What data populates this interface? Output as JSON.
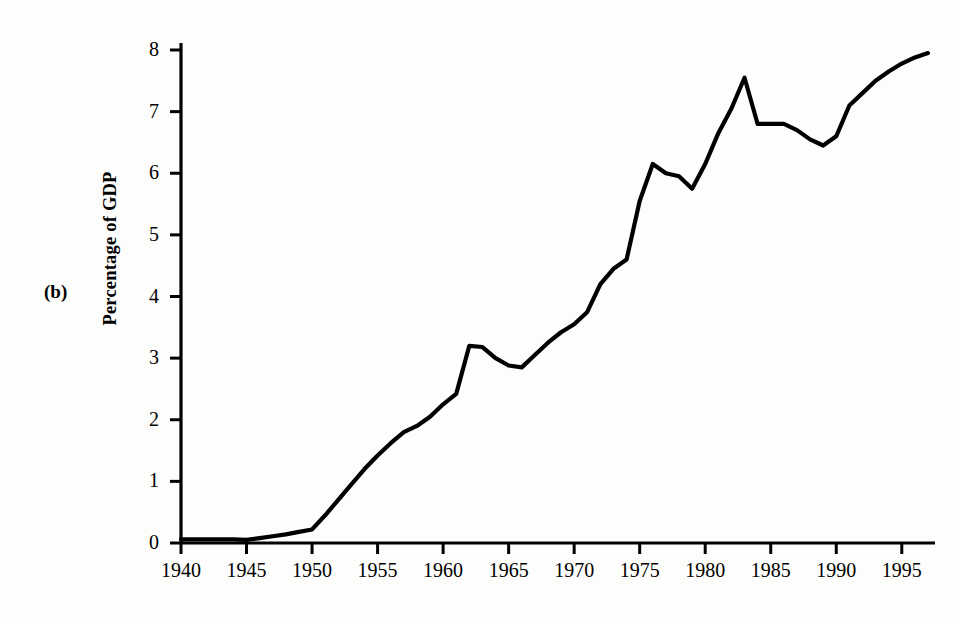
{
  "figure": {
    "panel_label": "(b)",
    "background_color": "#fdfdfb",
    "line_color": "#000000"
  },
  "chart_data": {
    "type": "line",
    "title": "",
    "subtitle": "",
    "xlabel": "",
    "ylabel": "Percentage of GDP",
    "xlim": [
      1940,
      1997
    ],
    "ylim": [
      0,
      8.3
    ],
    "grid": false,
    "legend": null,
    "x_ticks": [
      1940,
      1945,
      1950,
      1955,
      1960,
      1965,
      1970,
      1975,
      1980,
      1985,
      1990,
      1995
    ],
    "x_tick_labels": [
      "1940",
      "1945",
      "1950",
      "1955",
      "1960",
      "1965",
      "1970",
      "1975",
      "1980",
      "1985",
      "1990",
      "1995"
    ],
    "y_ticks": [
      0,
      1,
      2,
      3,
      4,
      5,
      6,
      7,
      8
    ],
    "y_tick_labels": [
      "0",
      "1",
      "2",
      "3",
      "4",
      "5",
      "6",
      "7",
      "8"
    ],
    "series": [
      {
        "name": "Percentage of GDP",
        "color": "#000000",
        "x": [
          1940,
          1941,
          1942,
          1943,
          1944,
          1945,
          1946,
          1947,
          1948,
          1949,
          1950,
          1951,
          1952,
          1953,
          1954,
          1955,
          1956,
          1957,
          1958,
          1959,
          1960,
          1961,
          1962,
          1963,
          1964,
          1965,
          1966,
          1967,
          1968,
          1969,
          1970,
          1971,
          1972,
          1973,
          1974,
          1975,
          1976,
          1977,
          1978,
          1979,
          1980,
          1981,
          1982,
          1983,
          1984,
          1985,
          1986,
          1987,
          1988,
          1989,
          1990,
          1991,
          1992,
          1993,
          1994,
          1995,
          1996,
          1997
        ],
        "y": [
          0.06,
          0.06,
          0.06,
          0.06,
          0.06,
          0.05,
          0.08,
          0.11,
          0.14,
          0.18,
          0.22,
          0.45,
          0.7,
          0.95,
          1.2,
          1.42,
          1.62,
          1.8,
          1.9,
          2.05,
          2.25,
          2.42,
          3.2,
          3.18,
          3.0,
          2.88,
          2.85,
          3.05,
          3.25,
          3.42,
          3.55,
          3.75,
          4.2,
          4.45,
          4.6,
          5.55,
          6.15,
          6.0,
          5.95,
          5.75,
          6.15,
          6.65,
          7.05,
          7.55,
          6.8,
          6.8,
          6.8,
          6.7,
          6.55,
          6.45,
          6.6,
          7.1,
          7.3,
          7.5,
          7.65,
          7.78,
          7.88,
          7.95
        ]
      }
    ]
  }
}
